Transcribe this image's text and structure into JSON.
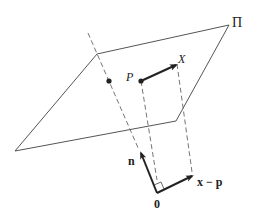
{
  "diagram": {
    "type": "geometry",
    "labels": {
      "plane": "Π",
      "point_p": "P",
      "point_x": "X",
      "normal": "n",
      "difference": "x − p",
      "origin": "0"
    },
    "colors": {
      "line": "#555555",
      "arrow": "#222222",
      "background": "#ffffff"
    }
  }
}
